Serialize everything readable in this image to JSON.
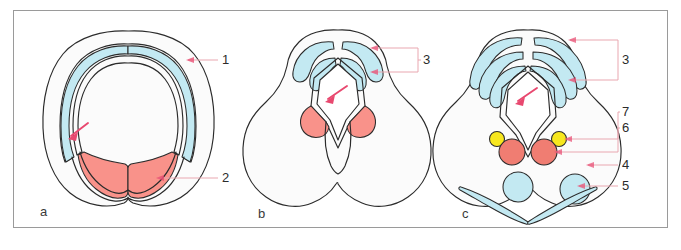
{
  "figure": {
    "frame": {
      "x": 13,
      "y": 10,
      "width": 655,
      "height": 218,
      "border_color": "#9a9a9a"
    },
    "background_color": "#ffffff",
    "panel_fill_color": "#fbfbfb",
    "outline_color": "#2b2b2b",
    "colors": {
      "cyan": "#c3e9f2",
      "salmon": "#f9928a",
      "salmon_deep": "#f07d72",
      "yellow": "#f7e71e",
      "leader_line": "#e9a7b0",
      "arrow": "#e8486f"
    }
  },
  "panels": [
    {
      "letter": "a",
      "letter_x": 40,
      "letter_y": 216,
      "callouts": [
        {
          "number": "1",
          "x": 225,
          "y": 60,
          "target": "cyan-lateral-band"
        },
        {
          "number": "2",
          "x": 225,
          "y": 178,
          "target": "salmon-ventral-mass"
        }
      ],
      "arrow": {
        "from_x": 86,
        "from_y": 125,
        "to_x": 68,
        "to_y": 138
      }
    },
    {
      "letter": "b",
      "letter_x": 258,
      "letter_y": 218,
      "callouts": [
        {
          "number": "3",
          "x": 425,
          "y": 62,
          "target": "cyan-dorsal-lobes"
        }
      ],
      "arrow": {
        "from_x": 345,
        "from_y": 88,
        "to_x": 325,
        "to_y": 101
      }
    },
    {
      "letter": "c",
      "letter_x": 462,
      "letter_y": 218,
      "callouts": [
        {
          "number": "3",
          "x": 625,
          "y": 60,
          "target": "cyan-dorsal-lobes"
        },
        {
          "number": "7",
          "x": 625,
          "y": 112,
          "target": "yellow-nodes"
        },
        {
          "number": "6",
          "x": 625,
          "y": 127,
          "target": "salmon-paired-nodes"
        },
        {
          "number": "4",
          "x": 625,
          "y": 163,
          "target": "cyan-round-body"
        },
        {
          "number": "5",
          "x": 625,
          "y": 182,
          "target": "cyan-blade"
        }
      ],
      "arrow": {
        "from_x": 533,
        "from_y": 90,
        "to_x": 515,
        "to_y": 103
      }
    }
  ],
  "legend_numbers": [
    "1",
    "2",
    "3",
    "4",
    "5",
    "6",
    "7"
  ]
}
